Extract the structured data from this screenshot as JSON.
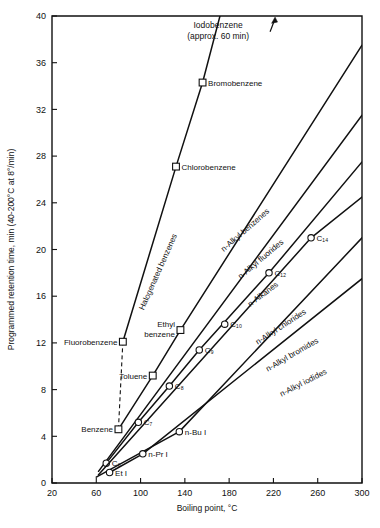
{
  "chart_data": {
    "type": "line",
    "title": "",
    "xlabel": "Boiling point, °C",
    "ylabel": "Programmed retention time, min (40-200°C at 8°/min)",
    "xlim": [
      20,
      300
    ],
    "ylim": [
      0,
      40
    ],
    "xticks": [
      20,
      60,
      100,
      140,
      180,
      220,
      260,
      300
    ],
    "yticks": [
      0,
      4,
      8,
      12,
      16,
      20,
      24,
      28,
      32,
      36,
      40
    ],
    "grid": false,
    "legend_position": "inline-along-curves",
    "series": [
      {
        "name": "Halogenated benzenes",
        "label": "Halogenated benzenes",
        "marker": "square",
        "label_x": 118,
        "label_y": 18.0,
        "label_rotation": -66,
        "x": [
          84,
          132,
          156,
          180
        ],
        "y": [
          12.1,
          27.1,
          34.3,
          43.0
        ],
        "points": [
          {
            "name": "Fluorobenzene",
            "x": 84,
            "y": 12.1,
            "label": "Fluorobenzene",
            "label_side": "left"
          },
          {
            "name": "Chlorobenzene",
            "x": 132,
            "y": 27.1,
            "label": "Chlorobenzene",
            "label_side": "right"
          },
          {
            "name": "Bromobenzene",
            "x": 156,
            "y": 34.3,
            "label": "Bromobenzene",
            "label_side": "right"
          }
        ]
      },
      {
        "name": "n-Alkyl benzenes",
        "label": "n-Alkyl benzenes",
        "marker": "square",
        "label_x": 196,
        "label_y": 21.5,
        "label_rotation": -41,
        "x": [
          80,
          111,
          136,
          300
        ],
        "y": [
          4.6,
          9.2,
          13.1,
          37.5
        ],
        "points": [
          {
            "name": "Benzene",
            "x": 80,
            "y": 4.6,
            "label": "Benzene",
            "label_side": "left"
          },
          {
            "name": "Toluene",
            "x": 111,
            "y": 9.2,
            "label": "Toluene",
            "label_side": "left"
          },
          {
            "name": "Ethyl benzene",
            "x": 136,
            "y": 13.1,
            "label": "Ethyl\nbenzene",
            "label_side": "left"
          }
        ]
      },
      {
        "name": "n-Alkyl fluorides",
        "label": "n-Alkyl fluorides",
        "marker": "circle",
        "label_x": 210,
        "label_y": 19.0,
        "label_rotation": -40,
        "x": [
          62,
          300
        ],
        "y": [
          1.0,
          31.5
        ],
        "points": []
      },
      {
        "name": "n-Alkanes",
        "label": "n-Alkanes",
        "marker": "circle",
        "label_x": 212,
        "label_y": 16.0,
        "label_rotation": -37,
        "x": [
          69,
          98,
          126,
          153,
          216,
          300
        ],
        "y": [
          1.7,
          5.2,
          8.3,
          11.4,
          18.0,
          27.5
        ],
        "points": [
          {
            "name": "C6",
            "x": 69,
            "y": 1.7,
            "label": "C₆",
            "label_side": "right"
          },
          {
            "name": "C7",
            "x": 98,
            "y": 5.2,
            "label": "C₇",
            "label_side": "right"
          },
          {
            "name": "C8",
            "x": 126,
            "y": 8.3,
            "label": "C₈",
            "label_side": "right"
          },
          {
            "name": "C9",
            "x": 153,
            "y": 11.4,
            "label": "C₉",
            "label_side": "right"
          },
          {
            "name": "C10",
            "x": 176,
            "y": 13.6,
            "label": "C₁₀",
            "label_side": "right"
          },
          {
            "name": "C12",
            "x": 216,
            "y": 18.0,
            "label": "C₁₂",
            "label_side": "right"
          }
        ]
      },
      {
        "name": "n-Alkyl chlorides",
        "label": "n-Alkyl chlorides",
        "marker": "circle",
        "label_x": 228,
        "label_y": 13.2,
        "label_rotation": -33,
        "x": [
          62,
          254,
          300
        ],
        "y": [
          0.7,
          21.0,
          24.5
        ],
        "points": [
          {
            "name": "C14",
            "x": 254,
            "y": 21.0,
            "label": "C₁₄",
            "label_side": "right"
          }
        ]
      },
      {
        "name": "n-Alkyl bromides",
        "label": "n-Alkyl bromides",
        "marker": "circle",
        "label_x": 238,
        "label_y": 10.8,
        "label_rotation": -30,
        "x": [
          60,
          135,
          300
        ],
        "y": [
          0.5,
          4.4,
          21.0
        ],
        "points": [
          {
            "name": "n-Bu I",
            "x": 135,
            "y": 4.4,
            "label": "n-Bu I",
            "label_side": "right"
          }
        ]
      },
      {
        "name": "n-Alkyl iodides",
        "label": "n-Alkyl iodides",
        "marker": "circle",
        "label_x": 248,
        "label_y": 8.4,
        "label_rotation": -27,
        "x": [
          72,
          102,
          300
        ],
        "y": [
          0.9,
          2.5,
          17.5
        ],
        "points": [
          {
            "name": "Et I",
            "x": 72,
            "y": 0.9,
            "label": "Et I",
            "label_side": "right"
          },
          {
            "name": "n-Pr I",
            "x": 102,
            "y": 2.5,
            "label": "n-Pr I",
            "label_side": "right"
          }
        ]
      }
    ],
    "annotations": [
      {
        "name": "iodobenzene-annotation",
        "line1": "Iodobenzene",
        "line2": "(approx. 60 min)",
        "x": 170,
        "y": 39.0,
        "arrow": "up"
      }
    ],
    "dashed_connector": {
      "name": "benzene-fluorobenzene-connector",
      "from": {
        "x": 80,
        "y": 4.6
      },
      "to": {
        "x": 84,
        "y": 12.1
      }
    }
  }
}
